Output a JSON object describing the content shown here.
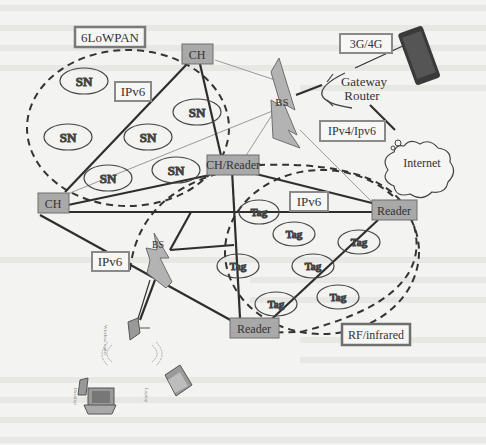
{
  "diagram": {
    "labels": {
      "sixlowpan": "6LoWPAN",
      "ipv6_top": "IPv6",
      "ipv6_mid": "IPv6",
      "ipv6_left": "IPv6",
      "g34": "3G/4G",
      "ipv4ipv6": "IPv4/Ipv6",
      "rf": "RF/infrared"
    },
    "nodes": {
      "ch_top": "CH",
      "ch_left": "CH",
      "ch_reader": "CH/Reader",
      "reader_right": "Reader",
      "reader_bottom": "Reader",
      "bs_top": "BS",
      "bs_bottom": "BS",
      "gateway_line1": "Gateway",
      "gateway_line2": "Router",
      "internet": "Internet"
    },
    "sensor_nodes": [
      "SN",
      "SN",
      "SN",
      "SN",
      "SN",
      "SN"
    ],
    "tags": [
      "Tag",
      "Tag",
      "Tag",
      "Tag",
      "Tag",
      "Tag",
      "Tag",
      "Tag"
    ],
    "devices": {
      "wireless_router": "Wireless router",
      "desktop": "Desktop",
      "laptop": "Laptop"
    },
    "colors": {
      "node_fill": "#a9a9a9",
      "node_stroke": "#6e6e6e",
      "label_border": "#8a8a8a",
      "line": "#2e2e2e",
      "background": "#f3f3f1"
    }
  }
}
